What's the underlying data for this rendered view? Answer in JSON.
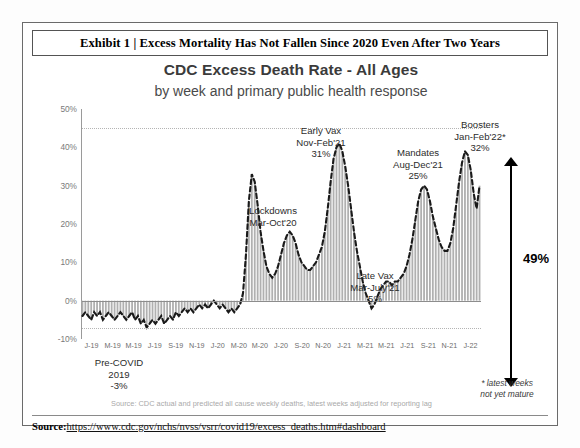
{
  "exhibit": {
    "title": "Exhibit 1 | Excess Mortality Has Not Fallen Since 2020 Even After Two Years"
  },
  "chart": {
    "title": "CDC Excess Death Rate - All Ages",
    "subtitle": "by week and primary public health response"
  },
  "footer": {
    "label": "Source:",
    "url": "https://www.cdc.gov/nchs/nvss/vsrr/covid19/excess_deaths.htm#dashboard"
  },
  "notes": {
    "source_note": "Source: CDC actual and predicted all cause weekly deaths, latest weeks adjusted for reporting lag",
    "mature_line1": "* latest weeks",
    "mature_line2": "not yet mature"
  },
  "bracket": {
    "label": "49%"
  },
  "annotations": [
    {
      "id": "pre-covid",
      "lines": [
        "Pre-COVID",
        "2019",
        "-3%"
      ],
      "x": 96,
      "y": 334
    },
    {
      "id": "lockdowns",
      "lines": [
        "Lockdowns",
        "Mar-Oct'20"
      ],
      "x": 250,
      "y": 182
    },
    {
      "id": "early-vax",
      "lines": [
        "Early Vax",
        "Nov-Feb'21",
        "31%"
      ],
      "x": 298,
      "y": 102
    },
    {
      "id": "late-vax",
      "lines": [
        "Late Vax",
        "Mar-July'21",
        "5%"
      ],
      "x": 352,
      "y": 247
    },
    {
      "id": "mandates",
      "lines": [
        "Mandates",
        "Aug-Dec'21",
        "25%"
      ],
      "x": 395,
      "y": 124
    },
    {
      "id": "boosters",
      "lines": [
        "Boosters",
        "Jan-Feb'22*",
        "32%"
      ],
      "x": 457,
      "y": 96
    }
  ],
  "chart_data": {
    "type": "bar",
    "title": "CDC Excess Death Rate - All Ages",
    "subtitle": "by week and primary public health response",
    "xlabel": "",
    "ylabel": "",
    "ylim": [
      -10,
      50
    ],
    "ytick_labels": [
      "50%",
      "40%",
      "30%",
      "20%",
      "10%",
      "0%",
      "-10%"
    ],
    "ytick_values": [
      50,
      40,
      30,
      20,
      10,
      0,
      -10
    ],
    "gridlines": [
      45,
      -7
    ],
    "grid": true,
    "legend": "none",
    "xtick_labels": [
      "J-19",
      "M-19",
      "M-19",
      "J-19",
      "S-19",
      "N-19",
      "J-20",
      "M-20",
      "M-20",
      "J-20",
      "S-20",
      "N-20",
      "J-21",
      "M-21",
      "M-21",
      "J-21",
      "S-21",
      "N-21",
      "J-22"
    ],
    "series": [
      {
        "name": "Excess death rate (weekly, %)",
        "render": "bars-with-dashed-trendline",
        "values": [
          -4,
          -3,
          -4,
          -5,
          -3,
          -4,
          -3,
          -5,
          -4,
          -3,
          -4,
          -5,
          -4,
          -3,
          -4,
          -5,
          -4,
          -3,
          -5,
          -4,
          -6,
          -5,
          -7,
          -6,
          -5,
          -6,
          -5,
          -4,
          -6,
          -5,
          -4,
          -5,
          -3,
          -4,
          -3,
          -2,
          -3,
          -2,
          -3,
          -2,
          -1,
          -2,
          -1,
          -2,
          -1,
          0,
          -1,
          -2,
          -1,
          -2,
          -3,
          -2,
          -3,
          -2,
          -1,
          2,
          12,
          26,
          33,
          31,
          25,
          18,
          13,
          9,
          7,
          6,
          7,
          9,
          12,
          15,
          17,
          18,
          17,
          15,
          12,
          10,
          9,
          8,
          8,
          9,
          10,
          12,
          14,
          18,
          24,
          31,
          37,
          40,
          41,
          39,
          35,
          30,
          24,
          18,
          13,
          9,
          5,
          2,
          0,
          -2,
          -1,
          1,
          3,
          4,
          5,
          5,
          4,
          5,
          5,
          6,
          7,
          9,
          12,
          16,
          21,
          26,
          29,
          30,
          29,
          26,
          22,
          19,
          16,
          14,
          13,
          13,
          15,
          19,
          25,
          31,
          36,
          39,
          38,
          34,
          28,
          24,
          30
        ]
      }
    ],
    "peak_annotations": [
      {
        "label": "Lockdowns",
        "period": "Mar-Oct'20",
        "value": null
      },
      {
        "label": "Early Vax",
        "period": "Nov-Feb'21",
        "value": 31
      },
      {
        "label": "Late Vax",
        "period": "Mar-July'21",
        "value": 5
      },
      {
        "label": "Mandates",
        "period": "Aug-Dec'21",
        "value": 25
      },
      {
        "label": "Boosters",
        "period": "Jan-Feb'22*",
        "value": 32
      },
      {
        "label": "Pre-COVID",
        "period": "2019",
        "value": -3
      }
    ],
    "range_marker": {
      "label": "49%",
      "from": -7,
      "to": 45
    },
    "colors": {
      "bar": "#b0b0b0",
      "line": "#1a1a1a",
      "axis": "#9a9a9a",
      "grid": "#b4b4b4"
    }
  }
}
